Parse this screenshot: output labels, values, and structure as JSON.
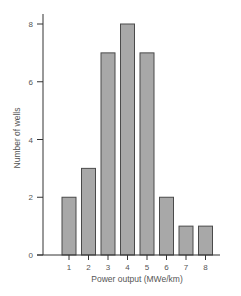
{
  "chart_data": {
    "type": "bar",
    "title": "",
    "xlabel": "Power output (MWe/km)",
    "ylabel": "Number of wells",
    "categories": [
      "1",
      "2",
      "3",
      "4",
      "5",
      "6",
      "7",
      "8"
    ],
    "values": [
      2,
      3,
      7,
      8,
      7,
      2,
      1,
      1
    ],
    "ylim": [
      0,
      8
    ],
    "yticks": [
      0,
      2,
      4,
      6,
      8
    ],
    "grid": false,
    "legend": null,
    "colors": {
      "bar_fill": "#a8a8a8",
      "bar_edge": "#4a4a4a",
      "axis": "#333333",
      "text": "#555555"
    }
  }
}
